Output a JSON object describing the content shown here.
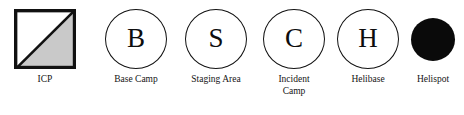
{
  "legend": {
    "title": "Incident Map Symbol Legend",
    "palette": {
      "stroke": "#111111",
      "fill_shade": "#c9c9c9",
      "fill_solid": "#0a0a0a",
      "background": "#ffffff"
    },
    "items": [
      {
        "id": "icp",
        "symbol_type": "square-half-shaded",
        "glyph": "",
        "label": "ICP",
        "fill": "#c9c9c9",
        "stroke": "#111111"
      },
      {
        "id": "base-camp",
        "symbol_type": "circle-letter",
        "glyph": "B",
        "label": "Base Camp",
        "fill": "none",
        "stroke": "#111111"
      },
      {
        "id": "staging-area",
        "symbol_type": "circle-letter",
        "glyph": "S",
        "label": "Staging Area",
        "fill": "none",
        "stroke": "#111111"
      },
      {
        "id": "incident-camp",
        "symbol_type": "circle-letter",
        "glyph": "C",
        "label": "Incident\nCamp",
        "fill": "none",
        "stroke": "#111111"
      },
      {
        "id": "helibase",
        "symbol_type": "circle-letter",
        "glyph": "H",
        "label": "Helibase",
        "fill": "none",
        "stroke": "#111111"
      },
      {
        "id": "helispot",
        "symbol_type": "circle-filled",
        "glyph": "",
        "label": "Helispot",
        "fill": "#0a0a0a",
        "stroke": "#0a0a0a"
      }
    ]
  }
}
